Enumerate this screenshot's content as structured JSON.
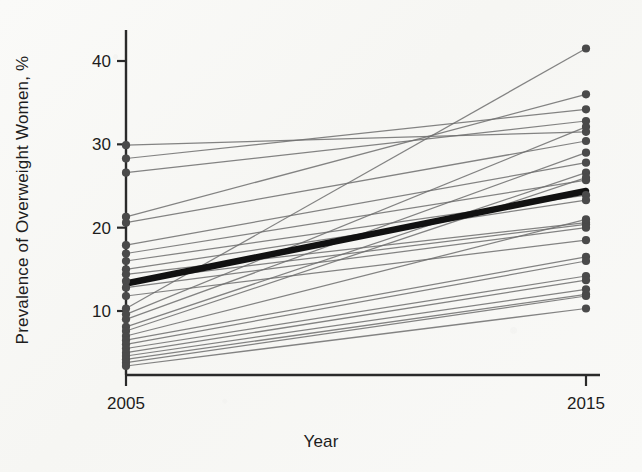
{
  "chart_data": {
    "type": "line",
    "title": "",
    "subtitle": "",
    "xlabel": "Year",
    "ylabel": "Prevalence of Overweight Women, %",
    "x": [
      2005,
      2015
    ],
    "categories": [
      "2005",
      "2015"
    ],
    "xtick_labels": [
      "2005",
      "2015"
    ],
    "ytick_labels": [
      "10",
      "20",
      "30",
      "40"
    ],
    "ytick_values": [
      10,
      20,
      30,
      40
    ],
    "xlim": [
      2005,
      2015
    ],
    "ylim": [
      3.0,
      43.0
    ],
    "grid": false,
    "legend": null,
    "legend_position": "none",
    "marker": "filled-circle",
    "annotations": [],
    "series": [
      {
        "name": "country-01",
        "values": [
          29.9,
          31.5
        ],
        "style": "thin-gray"
      },
      {
        "name": "country-02",
        "values": [
          28.3,
          34.2
        ],
        "style": "thin-gray"
      },
      {
        "name": "country-03",
        "values": [
          26.6,
          32.8
        ],
        "style": "thin-gray"
      },
      {
        "name": "country-04",
        "values": [
          21.3,
          36.0
        ],
        "style": "thin-gray"
      },
      {
        "name": "country-05",
        "values": [
          20.6,
          30.4
        ],
        "style": "thin-gray"
      },
      {
        "name": "country-06",
        "values": [
          17.9,
          27.8
        ],
        "style": "thin-gray"
      },
      {
        "name": "country-07",
        "values": [
          16.9,
          25.7
        ],
        "style": "thin-gray"
      },
      {
        "name": "country-08",
        "values": [
          16.0,
          23.9
        ],
        "style": "thin-gray"
      },
      {
        "name": "country-09",
        "values": [
          15.0,
          23.3
        ],
        "style": "thin-gray"
      },
      {
        "name": "country-10",
        "values": [
          14.4,
          20.6
        ],
        "style": "thin-gray"
      },
      {
        "name": "country-11",
        "values": [
          13.6,
          20.4
        ],
        "style": "thin-gray"
      },
      {
        "name": "country-12",
        "values": [
          12.8,
          20.0
        ],
        "style": "thin-gray"
      },
      {
        "name": "country-13",
        "values": [
          11.8,
          18.5
        ],
        "style": "thin-gray"
      },
      {
        "name": "country-14",
        "values": [
          10.3,
          41.5
        ],
        "style": "thin-gray"
      },
      {
        "name": "country-15",
        "values": [
          9.6,
          32.1
        ],
        "style": "thin-gray"
      },
      {
        "name": "country-16",
        "values": [
          9.0,
          29.0
        ],
        "style": "thin-gray"
      },
      {
        "name": "country-17",
        "values": [
          8.1,
          26.6
        ],
        "style": "thin-gray"
      },
      {
        "name": "country-18",
        "values": [
          7.6,
          26.0
        ],
        "style": "thin-gray"
      },
      {
        "name": "country-19",
        "values": [
          7.0,
          21.0
        ],
        "style": "thin-gray"
      },
      {
        "name": "country-20",
        "values": [
          6.5,
          16.5
        ],
        "style": "thin-gray"
      },
      {
        "name": "country-21",
        "values": [
          6.0,
          16.0
        ],
        "style": "thin-gray"
      },
      {
        "name": "country-22",
        "values": [
          5.5,
          14.2
        ],
        "style": "thin-gray"
      },
      {
        "name": "country-23",
        "values": [
          5.0,
          13.7
        ],
        "style": "thin-gray"
      },
      {
        "name": "country-24",
        "values": [
          4.6,
          12.6
        ],
        "style": "thin-gray"
      },
      {
        "name": "country-25",
        "values": [
          4.2,
          12.0
        ],
        "style": "thin-gray"
      },
      {
        "name": "country-26",
        "values": [
          3.8,
          11.8
        ],
        "style": "thin-gray"
      },
      {
        "name": "country-27",
        "values": [
          3.4,
          10.3
        ],
        "style": "thin-gray"
      },
      {
        "name": "pooled-mean",
        "values": [
          13.3,
          24.4
        ],
        "style": "bold-black"
      }
    ],
    "colors": {
      "line_gray": "#6f6f6f",
      "line_bold": "#111111",
      "marker": "#4a4a4a",
      "axis": "#2a2a2a",
      "background": "#f8f8f6"
    }
  }
}
